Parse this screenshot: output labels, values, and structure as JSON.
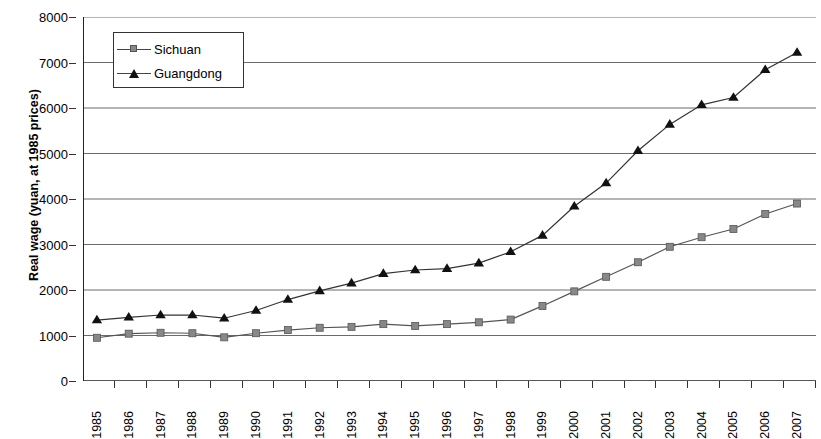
{
  "chart_data": {
    "type": "line",
    "title": "",
    "xlabel": "",
    "ylabel": "Real wage (yuan, at 1985 prices)",
    "ylim": [
      0,
      8000
    ],
    "ytick_values": [
      0,
      1000,
      2000,
      3000,
      4000,
      5000,
      6000,
      7000,
      8000
    ],
    "ytick_labels": [
      "0",
      "1000",
      "2000",
      "3000",
      "4000",
      "5000",
      "6000",
      "7000",
      "8000"
    ],
    "grid": "horizontal",
    "legend_position": "top-left-inside",
    "categories": [
      "1985",
      "1986",
      "1987",
      "1988",
      "1989",
      "1990",
      "1991",
      "1992",
      "1993",
      "1994",
      "1995",
      "1996",
      "1997",
      "1998",
      "1999",
      "2000",
      "2001",
      "2002",
      "2003",
      "2004",
      "2005",
      "2006",
      "2007"
    ],
    "series": [
      {
        "name": "Sichuan",
        "marker": "square",
        "marker_color": "#888888",
        "line_color": "#555555",
        "values": [
          950,
          1040,
          1060,
          1050,
          960,
          1050,
          1120,
          1170,
          1190,
          1250,
          1210,
          1250,
          1290,
          1350,
          1650,
          1970,
          2290,
          2610,
          2950,
          3160,
          3340,
          3670,
          3900
        ]
      },
      {
        "name": "Guangdong",
        "marker": "triangle",
        "marker_color": "#111111",
        "line_color": "#333333",
        "values": [
          1340,
          1400,
          1450,
          1450,
          1380,
          1550,
          1790,
          1980,
          2150,
          2360,
          2440,
          2470,
          2590,
          2840,
          3200,
          3840,
          4350,
          5060,
          5640,
          6070,
          6230,
          6840,
          7220
        ]
      }
    ]
  },
  "legend": {
    "items": [
      {
        "label": "Sichuan"
      },
      {
        "label": "Guangdong"
      }
    ]
  }
}
